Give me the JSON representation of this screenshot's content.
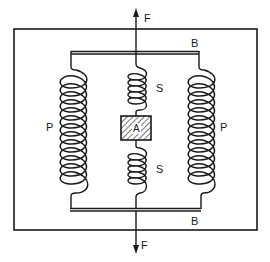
{
  "diagram": {
    "type": "spring-mass mechanical schematic",
    "labels": {
      "force_top": "F",
      "force_bottom": "F",
      "plate_top": "B",
      "plate_bottom": "B",
      "spring_left": "P",
      "spring_right": "P",
      "spring_center_upper": "S",
      "spring_center_lower": "S",
      "mass": "A"
    },
    "colors": {
      "ink": "#1a1a1a",
      "background": "#ffffff"
    }
  }
}
